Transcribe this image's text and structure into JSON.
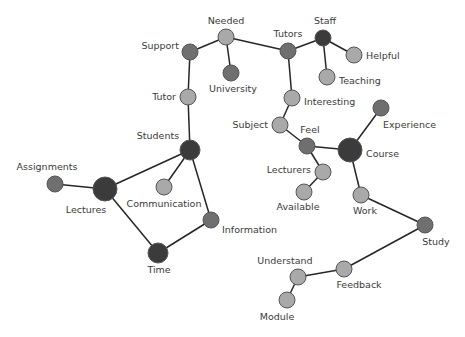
{
  "diagram": {
    "type": "network",
    "colors": {
      "dark": "#3b3b3b",
      "mid": "#6f6f6f",
      "light": "#a9a9a9",
      "edge": "#262626",
      "background": "#ffffff"
    },
    "nodes": [
      {
        "id": "needed",
        "label": "Needed",
        "x": 226,
        "y": 37,
        "r": 8,
        "tone": "light",
        "lx": 226,
        "ly": 24,
        "anchor": "middle"
      },
      {
        "id": "support",
        "label": "Support",
        "x": 190,
        "y": 52,
        "r": 8,
        "tone": "mid",
        "lx": 179,
        "ly": 49,
        "anchor": "end"
      },
      {
        "id": "university",
        "label": "University",
        "x": 231,
        "y": 73,
        "r": 8,
        "tone": "mid",
        "lx": 233,
        "ly": 92,
        "anchor": "middle"
      },
      {
        "id": "tutors",
        "label": "Tutors",
        "x": 288,
        "y": 51,
        "r": 8,
        "tone": "mid",
        "lx": 288,
        "ly": 37,
        "anchor": "middle"
      },
      {
        "id": "staff",
        "label": "Staff",
        "x": 323,
        "y": 38,
        "r": 8,
        "tone": "dark",
        "lx": 325,
        "ly": 24,
        "anchor": "middle"
      },
      {
        "id": "helpful",
        "label": "Helpful",
        "x": 354,
        "y": 55,
        "r": 8,
        "tone": "light",
        "lx": 366,
        "ly": 59,
        "anchor": "start"
      },
      {
        "id": "teaching",
        "label": "Teaching",
        "x": 327,
        "y": 77,
        "r": 8,
        "tone": "light",
        "lx": 339,
        "ly": 84,
        "anchor": "start"
      },
      {
        "id": "tutor",
        "label": "Tutor",
        "x": 188,
        "y": 97,
        "r": 8,
        "tone": "light",
        "lx": 176,
        "ly": 100,
        "anchor": "end"
      },
      {
        "id": "interesting",
        "label": "Interesting",
        "x": 292,
        "y": 98,
        "r": 8,
        "tone": "light",
        "lx": 304,
        "ly": 105,
        "anchor": "start"
      },
      {
        "id": "subject",
        "label": "Subject",
        "x": 280,
        "y": 125,
        "r": 8,
        "tone": "light",
        "lx": 268,
        "ly": 128,
        "anchor": "end"
      },
      {
        "id": "students",
        "label": "Students",
        "x": 190,
        "y": 150,
        "r": 10,
        "tone": "dark",
        "lx": 158,
        "ly": 139,
        "anchor": "middle"
      },
      {
        "id": "feel",
        "label": "Feel",
        "x": 307,
        "y": 146,
        "r": 8,
        "tone": "mid",
        "lx": 310,
        "ly": 133,
        "anchor": "middle"
      },
      {
        "id": "course",
        "label": "Course",
        "x": 350,
        "y": 150,
        "r": 12,
        "tone": "dark",
        "lx": 366,
        "ly": 157,
        "anchor": "start"
      },
      {
        "id": "experience",
        "label": "Experience",
        "x": 381,
        "y": 108,
        "r": 8,
        "tone": "mid",
        "lx": 383,
        "ly": 128,
        "anchor": "start"
      },
      {
        "id": "lecturers",
        "label": "Lecturers",
        "x": 323,
        "y": 172,
        "r": 8,
        "tone": "light",
        "lx": 311,
        "ly": 173,
        "anchor": "end"
      },
      {
        "id": "available",
        "label": "Available",
        "x": 304,
        "y": 192,
        "r": 8,
        "tone": "light",
        "lx": 298,
        "ly": 210,
        "anchor": "middle"
      },
      {
        "id": "work",
        "label": "Work",
        "x": 361,
        "y": 195,
        "r": 8,
        "tone": "light",
        "lx": 365,
        "ly": 214,
        "anchor": "middle"
      },
      {
        "id": "assignments",
        "label": "Assignments",
        "x": 55,
        "y": 184,
        "r": 8,
        "tone": "mid",
        "lx": 47,
        "ly": 170,
        "anchor": "middle"
      },
      {
        "id": "lectures",
        "label": "Lectures",
        "x": 105,
        "y": 189,
        "r": 12,
        "tone": "dark",
        "lx": 86,
        "ly": 213,
        "anchor": "middle"
      },
      {
        "id": "communication",
        "label": "Communication",
        "x": 164,
        "y": 187,
        "r": 8,
        "tone": "light",
        "lx": 164,
        "ly": 207,
        "anchor": "middle"
      },
      {
        "id": "information",
        "label": "Information",
        "x": 211,
        "y": 220,
        "r": 8,
        "tone": "mid",
        "lx": 222,
        "ly": 233,
        "anchor": "start"
      },
      {
        "id": "time",
        "label": "Time",
        "x": 158,
        "y": 253,
        "r": 10,
        "tone": "dark",
        "lx": 159,
        "ly": 273,
        "anchor": "middle"
      },
      {
        "id": "study",
        "label": "Study",
        "x": 425,
        "y": 225,
        "r": 8,
        "tone": "mid",
        "lx": 436,
        "ly": 245,
        "anchor": "middle"
      },
      {
        "id": "feedback",
        "label": "Feedback",
        "x": 344,
        "y": 269,
        "r": 8,
        "tone": "light",
        "lx": 359,
        "ly": 288,
        "anchor": "middle"
      },
      {
        "id": "understand",
        "label": "Understand",
        "x": 298,
        "y": 277,
        "r": 8,
        "tone": "light",
        "lx": 285,
        "ly": 264,
        "anchor": "middle"
      },
      {
        "id": "module",
        "label": "Module",
        "x": 287,
        "y": 300,
        "r": 8,
        "tone": "light",
        "lx": 277,
        "ly": 320,
        "anchor": "middle"
      }
    ],
    "edges": [
      [
        "support",
        "needed"
      ],
      [
        "needed",
        "university"
      ],
      [
        "needed",
        "tutors"
      ],
      [
        "tutors",
        "staff"
      ],
      [
        "staff",
        "helpful"
      ],
      [
        "staff",
        "teaching"
      ],
      [
        "support",
        "tutor"
      ],
      [
        "tutor",
        "students"
      ],
      [
        "tutors",
        "interesting"
      ],
      [
        "interesting",
        "subject"
      ],
      [
        "subject",
        "feel"
      ],
      [
        "feel",
        "course"
      ],
      [
        "course",
        "experience"
      ],
      [
        "feel",
        "lecturers"
      ],
      [
        "lecturers",
        "available"
      ],
      [
        "course",
        "work"
      ],
      [
        "work",
        "study"
      ],
      [
        "study",
        "feedback"
      ],
      [
        "feedback",
        "understand"
      ],
      [
        "understand",
        "module"
      ],
      [
        "students",
        "lectures"
      ],
      [
        "students",
        "communication"
      ],
      [
        "students",
        "information"
      ],
      [
        "assignments",
        "lectures"
      ],
      [
        "lectures",
        "time"
      ],
      [
        "time",
        "information"
      ]
    ]
  }
}
